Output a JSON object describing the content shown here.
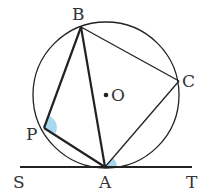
{
  "diagram": {
    "colors": {
      "stroke": "#222222",
      "angle_fill": "#a8d8f0",
      "label": "#333333"
    },
    "circle": {
      "center_label": "O",
      "cx": 106,
      "cy": 95,
      "r": 73
    },
    "points": {
      "B": {
        "label": "B",
        "x": 81,
        "y": 27
      },
      "C": {
        "label": "C",
        "x": 179,
        "y": 81
      },
      "P": {
        "label": "P",
        "x": 44,
        "y": 128
      },
      "A": {
        "label": "A",
        "x": 105,
        "y": 167
      },
      "O": {
        "label": "O",
        "x": 106,
        "y": 95
      },
      "S": {
        "label": "S",
        "x": 20,
        "y": 167
      },
      "T": {
        "label": "T",
        "x": 192,
        "y": 167
      }
    },
    "segments": [
      "BP",
      "PA",
      "BA",
      "BC",
      "CA",
      "ST"
    ],
    "marked_angles": [
      {
        "vertex": "P",
        "between": [
          "B",
          "A"
        ]
      },
      {
        "vertex": "A",
        "between": [
          "C",
          "T"
        ]
      }
    ]
  }
}
